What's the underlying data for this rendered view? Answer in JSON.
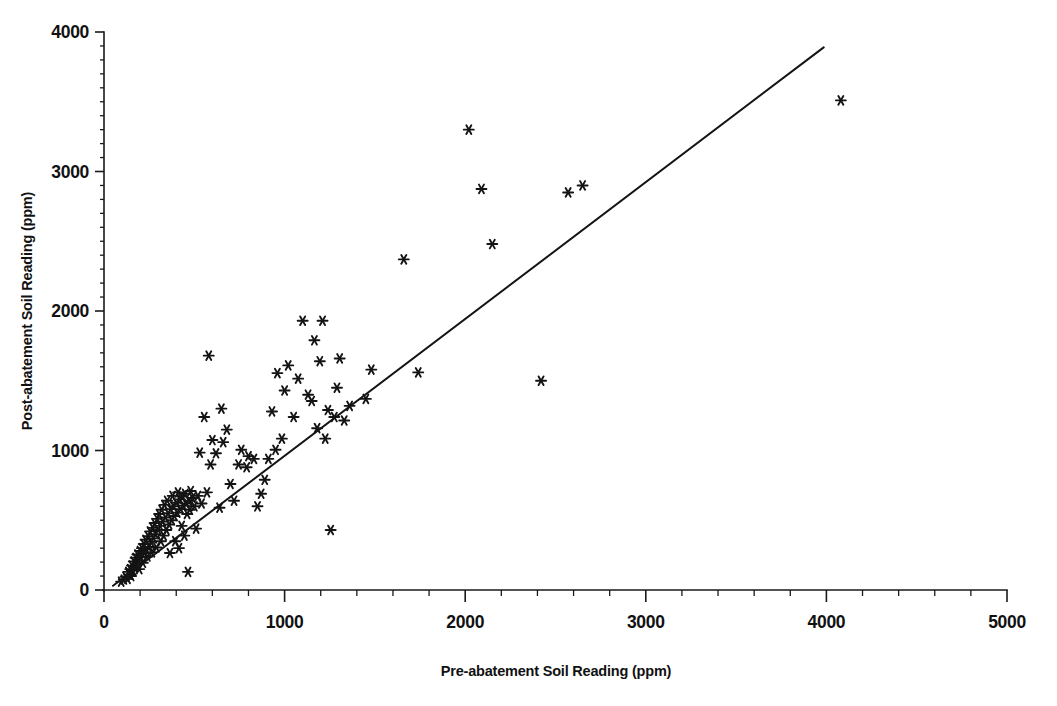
{
  "chart_data": {
    "type": "scatter",
    "title": "",
    "xlabel": "Pre-abatement Soil Reading (ppm)",
    "ylabel": "Post-abatement Soil Reading (ppm)",
    "xlim": [
      0,
      5000
    ],
    "ylim": [
      0,
      4000
    ],
    "xticks": [
      0,
      1000,
      2000,
      3000,
      4000,
      5000
    ],
    "yticks": [
      0,
      1000,
      2000,
      3000,
      4000
    ],
    "xtick_labels": [
      "0",
      "1000",
      "2000",
      "3000",
      "4000",
      "5000"
    ],
    "ytick_labels": [
      "0",
      "1000",
      "2000",
      "3000",
      "4000"
    ],
    "x_minor_interval": 200,
    "y_minor_interval": 100,
    "grid": false,
    "legend": false,
    "marker": "asterisk",
    "marker_color": "#141414",
    "series": [
      {
        "name": "Soil readings",
        "points": [
          [
            95,
            60
          ],
          [
            110,
            75
          ],
          [
            120,
            95
          ],
          [
            130,
            80
          ],
          [
            135,
            130
          ],
          [
            140,
            110
          ],
          [
            145,
            150
          ],
          [
            150,
            100
          ],
          [
            155,
            175
          ],
          [
            160,
            140
          ],
          [
            165,
            205
          ],
          [
            170,
            160
          ],
          [
            175,
            230
          ],
          [
            180,
            185
          ],
          [
            185,
            255
          ],
          [
            190,
            210
          ],
          [
            195,
            150
          ],
          [
            200,
            280
          ],
          [
            205,
            235
          ],
          [
            210,
            300
          ],
          [
            215,
            195
          ],
          [
            220,
            330
          ],
          [
            225,
            265
          ],
          [
            230,
            360
          ],
          [
            235,
            290
          ],
          [
            240,
            240
          ],
          [
            245,
            385
          ],
          [
            250,
            310
          ],
          [
            255,
            420
          ],
          [
            260,
            345
          ],
          [
            265,
            270
          ],
          [
            270,
            445
          ],
          [
            275,
            370
          ],
          [
            280,
            480
          ],
          [
            285,
            400
          ],
          [
            290,
            305
          ],
          [
            295,
            510
          ],
          [
            300,
            430
          ],
          [
            305,
            545
          ],
          [
            310,
            460
          ],
          [
            315,
            350
          ],
          [
            320,
            575
          ],
          [
            325,
            490
          ],
          [
            330,
            390
          ],
          [
            335,
            610
          ],
          [
            340,
            520
          ],
          [
            345,
            430
          ],
          [
            350,
            640
          ],
          [
            355,
            550
          ],
          [
            360,
            470
          ],
          [
            365,
            265
          ],
          [
            370,
            580
          ],
          [
            375,
            500
          ],
          [
            380,
            675
          ],
          [
            385,
            600
          ],
          [
            390,
            530
          ],
          [
            395,
            350
          ],
          [
            400,
            625
          ],
          [
            405,
            555
          ],
          [
            410,
            700
          ],
          [
            415,
            300
          ],
          [
            420,
            650
          ],
          [
            425,
            580
          ],
          [
            430,
            460
          ],
          [
            435,
            670
          ],
          [
            440,
            605
          ],
          [
            445,
            390
          ],
          [
            450,
            690
          ],
          [
            455,
            620
          ],
          [
            460,
            545
          ],
          [
            465,
            130
          ],
          [
            470,
            640
          ],
          [
            475,
            575
          ],
          [
            480,
            710
          ],
          [
            490,
            660
          ],
          [
            500,
            600
          ],
          [
            510,
            440
          ],
          [
            520,
            675
          ],
          [
            530,
            985
          ],
          [
            540,
            620
          ],
          [
            555,
            1240
          ],
          [
            570,
            700
          ],
          [
            580,
            1680
          ],
          [
            590,
            900
          ],
          [
            600,
            1075
          ],
          [
            620,
            980
          ],
          [
            640,
            590
          ],
          [
            650,
            1300
          ],
          [
            660,
            1060
          ],
          [
            680,
            1150
          ],
          [
            700,
            760
          ],
          [
            720,
            640
          ],
          [
            745,
            900
          ],
          [
            760,
            1005
          ],
          [
            790,
            880
          ],
          [
            800,
            960
          ],
          [
            830,
            940
          ],
          [
            850,
            600
          ],
          [
            870,
            690
          ],
          [
            890,
            790
          ],
          [
            910,
            940
          ],
          [
            930,
            1280
          ],
          [
            950,
            1005
          ],
          [
            960,
            1555
          ],
          [
            985,
            1085
          ],
          [
            1000,
            1430
          ],
          [
            1020,
            1610
          ],
          [
            1050,
            1240
          ],
          [
            1075,
            1515
          ],
          [
            1100,
            1930
          ],
          [
            1130,
            1400
          ],
          [
            1150,
            1355
          ],
          [
            1165,
            1790
          ],
          [
            1180,
            1160
          ],
          [
            1195,
            1640
          ],
          [
            1210,
            1930
          ],
          [
            1225,
            1085
          ],
          [
            1240,
            1290
          ],
          [
            1255,
            430
          ],
          [
            1275,
            1240
          ],
          [
            1290,
            1450
          ],
          [
            1305,
            1660
          ],
          [
            1330,
            1215
          ],
          [
            1360,
            1320
          ],
          [
            1450,
            1370
          ],
          [
            1480,
            1580
          ],
          [
            1660,
            2370
          ],
          [
            1740,
            1560
          ],
          [
            2020,
            3300
          ],
          [
            2090,
            2875
          ],
          [
            2150,
            2480
          ],
          [
            2420,
            1500
          ],
          [
            2570,
            2850
          ],
          [
            2650,
            2900
          ],
          [
            4080,
            3510
          ]
        ]
      }
    ],
    "fit_line": {
      "name": "regression-line",
      "x0": 50,
      "y0": 30,
      "x1": 3985,
      "y1": 3890,
      "color": "#141414"
    }
  },
  "axes": {
    "x_title": "Pre-abatement Soil Reading (ppm)",
    "y_title": "Post-abatement Soil Reading (ppm)"
  }
}
